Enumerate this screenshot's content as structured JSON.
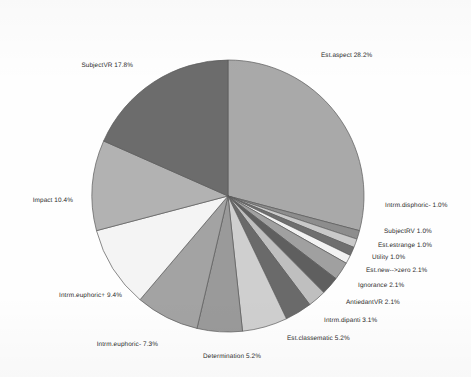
{
  "chart_data": {
    "type": "pie",
    "title": "",
    "subtitle": "",
    "xlabel": "",
    "ylabel": "",
    "legend_position": "none",
    "labels_outside": true,
    "value_unit": "%",
    "start_angle_deg": 0,
    "direction": "clockwise",
    "categories": [
      "Est.aspect",
      "Intrm.disphoric-",
      "SubjectRV",
      "Est.estrange",
      "Utility",
      "Est.new-->zero",
      "Ignorance",
      "AntiedantVR",
      "Intrm.dipanti",
      "Est.classematic",
      "Determination",
      "Intrm.euphoric-",
      "Intrm.euphoric+",
      "Impact",
      "SubjectVR"
    ],
    "values": [
      28.2,
      1.0,
      1.0,
      1.0,
      1.0,
      2.1,
      2.1,
      2.1,
      3.1,
      5.2,
      5.2,
      7.3,
      9.4,
      10.4,
      17.8
    ],
    "colors": [
      "#a9a9a9",
      "#8d8d8d",
      "#c9c9c9",
      "#6f6f6f",
      "#f2f2f2",
      "#a0a0a0",
      "#5f5f5f",
      "#bfbfbf",
      "#6a6a6a",
      "#cfcfcf",
      "#9a9a9a",
      "#a3a3a3",
      "#f4f4f4",
      "#b2b2b2",
      "#6c6c6c"
    ],
    "slices": [
      {
        "label": "Est.aspect 28.2%",
        "name": "Est.aspect",
        "value": 28.2,
        "color": "#a9a9a9",
        "lx": 321,
        "ly": 56,
        "align": "right"
      },
      {
        "label": "Intrm.disphoric- 1.0%",
        "name": "Intrm.disphoric-",
        "value": 1.0,
        "color": "#8d8d8d",
        "lx": 385,
        "ly": 206,
        "align": "right"
      },
      {
        "label": "SubjectRV 1.0%",
        "name": "SubjectRV",
        "value": 1.0,
        "color": "#c9c9c9",
        "lx": 384,
        "ly": 232,
        "align": "right"
      },
      {
        "label": "Est.estrange 1.0%",
        "name": "Est.estrange",
        "value": 1.0,
        "color": "#6f6f6f",
        "lx": 378,
        "ly": 246,
        "align": "right"
      },
      {
        "label": "Utility 1.0%",
        "name": "Utility",
        "value": 1.0,
        "color": "#f2f2f2",
        "lx": 372,
        "ly": 258,
        "align": "right"
      },
      {
        "label": "Est.new-->zero 2.1%",
        "name": "Est.new-->zero",
        "value": 2.1,
        "color": "#a0a0a0",
        "lx": 366,
        "ly": 271,
        "align": "right"
      },
      {
        "label": "Ignorance 2.1%",
        "name": "Ignorance",
        "value": 2.1,
        "color": "#5f5f5f",
        "lx": 358,
        "ly": 286,
        "align": "right"
      },
      {
        "label": "AntiedantVR 2.1%",
        "name": "AntiedantVR",
        "value": 2.1,
        "color": "#bfbfbf",
        "lx": 346,
        "ly": 303,
        "align": "right"
      },
      {
        "label": "Intrm.dipanti 3.1%",
        "name": "Intrm.dipanti",
        "value": 3.1,
        "color": "#6a6a6a",
        "lx": 324,
        "ly": 321,
        "align": "right"
      },
      {
        "label": "Est.classematic 5.2%",
        "name": "Est.classematic",
        "value": 5.2,
        "color": "#cfcfcf",
        "lx": 287,
        "ly": 339,
        "align": "right"
      },
      {
        "label": "Determination 5.2%",
        "name": "Determination",
        "value": 5.2,
        "color": "#9a9a9a",
        "lx": 232,
        "ly": 357,
        "align": "center"
      },
      {
        "label": "Intrm.euphoric- 7.3%",
        "name": "Intrm.euphoric-",
        "value": 7.3,
        "color": "#a3a3a3",
        "lx": 158,
        "ly": 345,
        "align": "left"
      },
      {
        "label": "Intrm.euphoric+ 9.4%",
        "name": "Intrm.euphoric+",
        "value": 9.4,
        "color": "#f4f4f4",
        "lx": 122,
        "ly": 296,
        "align": "left"
      },
      {
        "label": "Impact 10.4%",
        "name": "Impact",
        "value": 10.4,
        "color": "#b2b2b2",
        "lx": 73,
        "ly": 201,
        "align": "left"
      },
      {
        "label": "SubjectVR 17.8%",
        "name": "SubjectVR",
        "value": 17.8,
        "color": "#6c6c6c",
        "lx": 133,
        "ly": 66,
        "align": "left"
      }
    ],
    "geometry": {
      "cx": 228,
      "cy": 196,
      "r": 136
    }
  }
}
